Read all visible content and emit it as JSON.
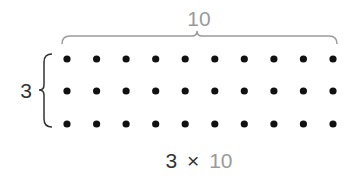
{
  "diagram": {
    "rows": 3,
    "columns": 10,
    "columns_label": "10",
    "rows_label": "3",
    "expression": {
      "left": "3",
      "operator": "×",
      "right": "10"
    },
    "colors": {
      "dot": "#111111",
      "brace": "#9a9a9a",
      "left_brace": "#333333",
      "dark_text": "#333333",
      "light_text": "#9a9a9a"
    }
  }
}
